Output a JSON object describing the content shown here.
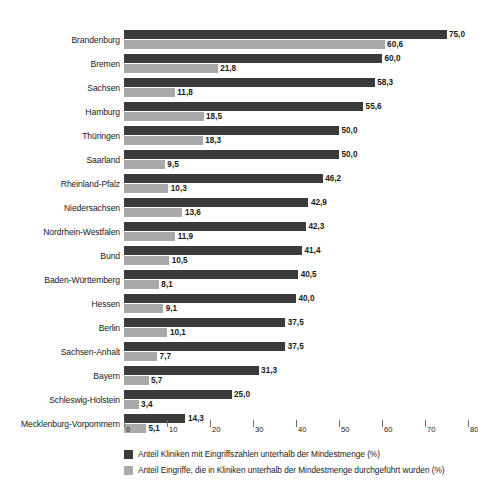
{
  "chart_data": {
    "type": "bar",
    "orientation": "horizontal",
    "title": "",
    "xlabel": "",
    "ylabel": "",
    "xlim": [
      0,
      80
    ],
    "xticks": [
      0,
      10,
      20,
      30,
      40,
      50,
      60,
      70,
      80
    ],
    "xtick_labels": [
      "0",
      "10",
      "20",
      "30",
      "40",
      "50",
      "60",
      "70",
      "80"
    ],
    "grid": false,
    "legend_position": "bottom",
    "decimal_separator": ",",
    "categories": [
      "Brandenburg",
      "Bremen",
      "Sachsen",
      "Hamburg",
      "Thüringen",
      "Saarland",
      "Rheinland-Pfalz",
      "Niedersachsen",
      "Nordrhein-Westfalen",
      "Bund",
      "Baden-Württemberg",
      "Hessen",
      "Berlin",
      "Sachsen-Anhalt",
      "Bayern",
      "Schleswig-Holstein",
      "Mecklenburg-Vorpommern"
    ],
    "series": [
      {
        "name": "Anteil Kliniken mit Eingriffszahlen unterhalb der Mindestmenge (%)",
        "color": "#3a3a3a",
        "values": [
          75.0,
          60.0,
          58.3,
          55.6,
          50.0,
          50.0,
          46.2,
          42.9,
          42.3,
          41.4,
          40.5,
          40.0,
          37.5,
          37.5,
          31.3,
          25.0,
          14.3
        ],
        "labels": [
          "75,0",
          "60,0",
          "58,3",
          "55,6",
          "50,0",
          "50,0",
          "46,2",
          "42,9",
          "42,3",
          "41,4",
          "40,5",
          "40,0",
          "37,5",
          "37,5",
          "31,3",
          "25,0",
          "14,3"
        ]
      },
      {
        "name": "Anteil Eingriffe, die in Kliniken unterhalb der Mindestmenge durchgeführt wurden (%)",
        "color": "#a9a9a9",
        "values": [
          60.6,
          21.8,
          11.8,
          18.5,
          18.3,
          9.5,
          10.3,
          13.6,
          11.9,
          10.5,
          8.1,
          9.1,
          10.1,
          7.7,
          5.7,
          3.4,
          5.1
        ],
        "labels": [
          "60,6",
          "21,8",
          "11,8",
          "18,5",
          "18,3",
          "9,5",
          "10,3",
          "13,6",
          "11,9",
          "10,5",
          "8,1",
          "9,1",
          "10,1",
          "7,7",
          "5,7",
          "3,4",
          "5,1"
        ]
      }
    ]
  },
  "legend": {
    "items": [
      {
        "label": "Anteil Kliniken mit Eingriffszahlen unterhalb der Mindestmenge (%)",
        "color": "#3a3a3a"
      },
      {
        "label": "Anteil Eingriffe, die in Kliniken unterhalb der Mindestmenge durchgeführt wurden (%)",
        "color": "#a9a9a9"
      }
    ]
  }
}
